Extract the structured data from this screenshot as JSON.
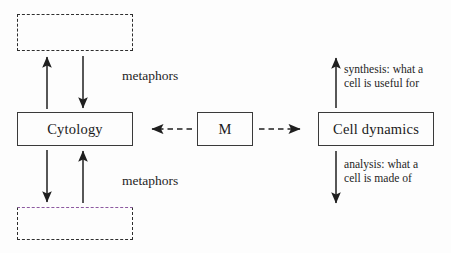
{
  "diagram": {
    "type": "flow-diagram",
    "title": "",
    "background_color": "#fdfdfd",
    "accent_color": "#8d5aa0",
    "line_color": "#2e2e2e",
    "nodes": [
      {
        "id": "top-placeholder",
        "label": "",
        "style": "dashed",
        "x": 17,
        "y": 14,
        "w": 116,
        "h": 37
      },
      {
        "id": "cytology",
        "label": "Cytology",
        "style": "solid",
        "x": 17,
        "y": 112,
        "w": 116,
        "h": 34
      },
      {
        "id": "bottom-placeholder",
        "label": "",
        "style": "dashed-accent",
        "x": 17,
        "y": 207,
        "w": 116,
        "h": 33
      },
      {
        "id": "m",
        "label": "M",
        "style": "solid",
        "x": 197,
        "y": 112,
        "w": 56,
        "h": 34
      },
      {
        "id": "cell-dynamics",
        "label": "Cell dynamics",
        "style": "solid",
        "x": 318,
        "y": 112,
        "w": 116,
        "h": 34
      }
    ],
    "edge_labels": [
      {
        "id": "metaphors-upper",
        "text": "metaphors",
        "x": 122,
        "y": 68
      },
      {
        "id": "metaphors-lower",
        "text": "metaphors",
        "x": 122,
        "y": 173
      },
      {
        "id": "synthesis-note",
        "text": "synthesis: what a\ncell is useful for",
        "x": 344,
        "y": 63
      },
      {
        "id": "analysis-note",
        "text": "analysis: what a\ncell is made of",
        "x": 344,
        "y": 158
      }
    ],
    "edges": [
      {
        "id": "up-left-to-top",
        "from": "cytology",
        "to": "top-placeholder",
        "direction": "up",
        "style": "solid"
      },
      {
        "id": "down-top-to-left",
        "from": "top-placeholder",
        "to": "cytology",
        "direction": "down",
        "style": "solid"
      },
      {
        "id": "down-left-to-bottom",
        "from": "cytology",
        "to": "bottom-placeholder",
        "direction": "down",
        "style": "solid"
      },
      {
        "id": "up-bottom-to-left",
        "from": "bottom-placeholder",
        "to": "cytology",
        "direction": "up",
        "style": "solid"
      },
      {
        "id": "m-to-cytology",
        "from": "m",
        "to": "cytology",
        "direction": "left",
        "style": "dashed"
      },
      {
        "id": "m-to-cell-dynamics",
        "from": "m",
        "to": "cell-dynamics",
        "direction": "right",
        "style": "dashed"
      },
      {
        "id": "synthesis-arrow",
        "from": "cell-dynamics",
        "to": "synthesis-note",
        "direction": "up",
        "style": "solid"
      },
      {
        "id": "analysis-arrow",
        "from": "cell-dynamics",
        "to": "analysis-note",
        "direction": "down",
        "style": "solid"
      }
    ]
  }
}
